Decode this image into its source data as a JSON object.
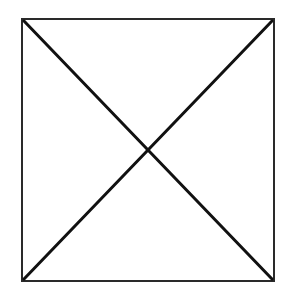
{
  "diagram": {
    "canvas": {
      "width": 288,
      "height": 296
    },
    "background_color": "#ffffff",
    "square": {
      "x": 22,
      "y": 19,
      "width": 252,
      "height": 262,
      "stroke_color": "#2a2a2a",
      "stroke_width": 2
    },
    "diagonals": [
      {
        "name": "top-left-to-bottom-right",
        "x1": 24,
        "y1": 21,
        "x2": 272,
        "y2": 279
      },
      {
        "name": "top-right-to-bottom-left",
        "x1": 272,
        "y1": 21,
        "x2": 24,
        "y2": 279
      }
    ],
    "diagonal_stroke_color": "#111111",
    "diagonal_stroke_width": 3
  }
}
